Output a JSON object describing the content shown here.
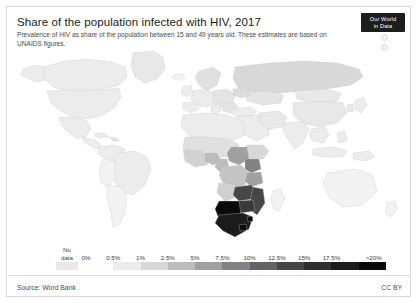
{
  "header": {
    "title": "Share of the population infected with HIV, 2017",
    "subtitle": "Prevalence of HIV as share of the population between 15 and 49 years old. These estimates are based on UNAIDS figures."
  },
  "logo": {
    "line1": "Our World",
    "line2": "in Data"
  },
  "footer": {
    "source": "Source: Word Bank",
    "license": "CC BY"
  },
  "chart_data": {
    "type": "heatmap",
    "title": "Share of the population infected with HIV, 2017",
    "subtitle": "Prevalence of HIV as share of the population between 15 and 49 years old. These estimates are based on UNAIDS figures.",
    "projection": "world-choropleth",
    "unit": "%",
    "no_data_label_line1": "No",
    "no_data_label_line2": "data",
    "no_data_color": "#e8e8e8",
    "legend_position": "bottom",
    "grid": false,
    "bins": [
      {
        "label": "0%",
        "color": "#fdfdfd"
      },
      {
        "label": "0.5%",
        "color": "#ececec"
      },
      {
        "label": "1%",
        "color": "#d8d8d8"
      },
      {
        "label": "2.5%",
        "color": "#bcbcbc"
      },
      {
        "label": "5%",
        "color": "#a0a0a0"
      },
      {
        "label": "7.5%",
        "color": "#828282"
      },
      {
        "label": "10%",
        "color": "#636363"
      },
      {
        "label": "12.5%",
        "color": "#474747"
      },
      {
        "label": "15%",
        "color": "#303030"
      },
      {
        "label": "17.5%",
        "color": "#1c1c1c"
      },
      {
        "label": ">20%",
        "color": "#0a0a0a"
      }
    ],
    "countries": [
      {
        "name": "Eswatini",
        "value": 27.4,
        "color": "#0a0a0a"
      },
      {
        "name": "Lesotho",
        "value": 23.8,
        "color": "#0a0a0a"
      },
      {
        "name": "Botswana",
        "value": 22.8,
        "color": "#0a0a0a"
      },
      {
        "name": "South Africa",
        "value": 18.8,
        "color": "#1c1c1c"
      },
      {
        "name": "Namibia",
        "value": 12.1,
        "color": "#474747"
      },
      {
        "name": "Zimbabwe",
        "value": 13.3,
        "color": "#474747"
      },
      {
        "name": "Zambia",
        "value": 11.5,
        "color": "#474747"
      },
      {
        "name": "Mozambique",
        "value": 12.5,
        "color": "#474747"
      },
      {
        "name": "Malawi",
        "value": 9.6,
        "color": "#636363"
      },
      {
        "name": "Tanzania",
        "value": 4.5,
        "color": "#a0a0a0"
      },
      {
        "name": "Uganda",
        "value": 5.9,
        "color": "#828282"
      },
      {
        "name": "Kenya",
        "value": 4.8,
        "color": "#a0a0a0"
      },
      {
        "name": "Central African Republic",
        "value": 4.0,
        "color": "#a0a0a0"
      },
      {
        "name": "Cameroon",
        "value": 3.6,
        "color": "#bcbcbc"
      },
      {
        "name": "Gabon",
        "value": 3.6,
        "color": "#bcbcbc"
      },
      {
        "name": "Angola",
        "value": 1.9,
        "color": "#d8d8d8"
      },
      {
        "name": "Nigeria",
        "value": 2.8,
        "color": "#bcbcbc"
      },
      {
        "name": "Russia",
        "value": 1.2,
        "color": "#d8d8d8"
      },
      {
        "name": "Brazil",
        "value": 0.5,
        "color": "#ececec"
      },
      {
        "name": "United States",
        "value": 0.4,
        "color": "#ececec"
      },
      {
        "name": "India",
        "value": 0.2,
        "color": "#ececec"
      },
      {
        "name": "China",
        "value": 0.1,
        "color": "#fdfdfd"
      },
      {
        "name": "Australia",
        "value": 0.1,
        "color": "#fdfdfd"
      },
      {
        "name": "Greenland",
        "value": null,
        "color": "#e8e8e8"
      }
    ]
  }
}
